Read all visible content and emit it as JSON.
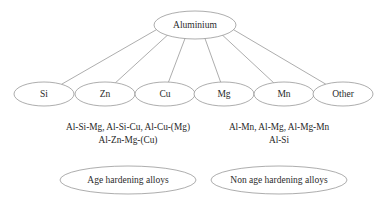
{
  "diagram": {
    "type": "tree",
    "title_node": {
      "id": "aluminium",
      "label": "Aluminium",
      "cx": 195,
      "cy": 25,
      "rx": 41,
      "ry": 14
    },
    "children": [
      {
        "id": "si",
        "label": "Si",
        "cx": 44,
        "cy": 94,
        "rx": 30,
        "ry": 12
      },
      {
        "id": "zn",
        "label": "Zn",
        "cx": 105,
        "cy": 94,
        "rx": 30,
        "ry": 12
      },
      {
        "id": "cu",
        "label": "Cu",
        "cx": 165,
        "cy": 94,
        "rx": 30,
        "ry": 12
      },
      {
        "id": "mg",
        "label": "Mg",
        "cx": 224,
        "cy": 94,
        "rx": 30,
        "ry": 12
      },
      {
        "id": "mn",
        "label": "Mn",
        "cx": 284,
        "cy": 94,
        "rx": 30,
        "ry": 12
      },
      {
        "id": "other",
        "label": "Other",
        "cx": 343,
        "cy": 94,
        "rx": 30,
        "ry": 12
      }
    ],
    "alloy_lists": [
      {
        "id": "age-hardening-alloys-list",
        "cx": 128,
        "lines": [
          "Al-Si-Mg, Al-Si-Cu, Al-Cu-(Mg)",
          "Al-Zn-Mg-(Cu)"
        ]
      },
      {
        "id": "non-age-hardening-alloys-list",
        "cx": 279,
        "lines": [
          "Al-Mn, Al-Mg, Al-Mg-Mn",
          "Al-Si"
        ]
      }
    ],
    "group_nodes": [
      {
        "id": "age-hardening-alloys",
        "label": "Age hardening alloys",
        "cx": 128,
        "cy": 180,
        "rx": 68,
        "ry": 14
      },
      {
        "id": "non-age-hardening-alloys",
        "label": "Non age hardening alloys",
        "cx": 279,
        "cy": 180,
        "rx": 68,
        "ry": 14
      }
    ],
    "colors": {
      "stroke": "#8a8a8a",
      "text": "#262626",
      "background": "#ffffff"
    }
  }
}
